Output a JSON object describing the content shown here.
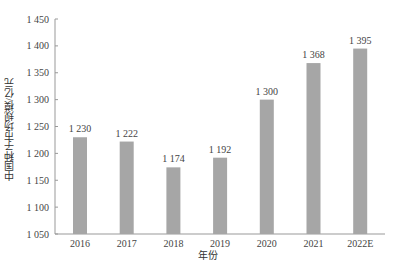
{
  "chart_data": {
    "type": "bar",
    "title": "",
    "xlabel": "年份",
    "ylabel": "中国种子市场规模/亿元",
    "categories": [
      "2016",
      "2017",
      "2018",
      "2019",
      "2020",
      "2021",
      "2022E"
    ],
    "values": [
      1230,
      1222,
      1174,
      1192,
      1300,
      1368,
      1395
    ],
    "value_labels": [
      "1 230",
      "1 222",
      "1 174",
      "1 192",
      "1 300",
      "1 368",
      "1 395"
    ],
    "ylim": [
      1050,
      1450
    ],
    "yticks": [
      1050,
      1100,
      1150,
      1200,
      1250,
      1300,
      1350,
      1400,
      1450
    ],
    "ytick_labels": [
      "1 050",
      "1 100",
      "1 150",
      "1 200",
      "1 250",
      "1 300",
      "1 350",
      "1 400",
      "1 450"
    ],
    "grid": false,
    "legend": null,
    "bar_color": "#a6a6a6"
  }
}
